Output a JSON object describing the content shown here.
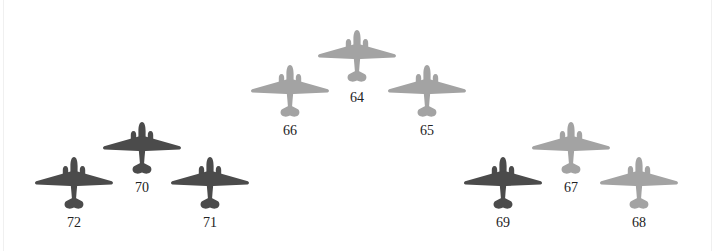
{
  "diagram": {
    "colors": {
      "light": "#a3a3a3",
      "dark": "#4b4b4b",
      "label": "#222222"
    },
    "aircraft": [
      {
        "id": "64",
        "label": "64",
        "shade": "light",
        "cx": 357,
        "top": 30,
        "label_top": 90
      },
      {
        "id": "66",
        "label": "66",
        "shade": "light",
        "cx": 290,
        "top": 65,
        "label_top": 123
      },
      {
        "id": "65",
        "label": "65",
        "shade": "light",
        "cx": 427,
        "top": 65,
        "label_top": 123
      },
      {
        "id": "70",
        "label": "70",
        "shade": "dark",
        "cx": 142,
        "top": 122,
        "label_top": 180
      },
      {
        "id": "72",
        "label": "72",
        "shade": "dark",
        "cx": 74,
        "top": 157,
        "label_top": 215
      },
      {
        "id": "71",
        "label": "71",
        "shade": "dark",
        "cx": 210,
        "top": 157,
        "label_top": 215
      },
      {
        "id": "67",
        "label": "67",
        "shade": "light",
        "cx": 571,
        "top": 122,
        "label_top": 180
      },
      {
        "id": "69",
        "label": "69",
        "shade": "dark",
        "cx": 503,
        "top": 157,
        "label_top": 215
      },
      {
        "id": "68",
        "label": "68",
        "shade": "light",
        "cx": 639,
        "top": 157,
        "label_top": 215
      }
    ]
  }
}
